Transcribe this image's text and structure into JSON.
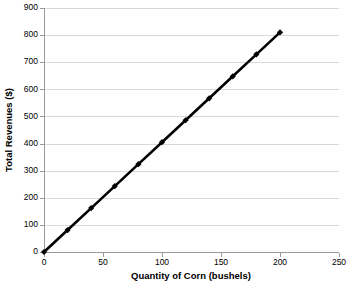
{
  "chart_data": {
    "type": "line",
    "title": "",
    "xlabel": "Quantity of Corn (bushels)",
    "ylabel": "Total Revenues ($)",
    "xlim": [
      0,
      250
    ],
    "ylim": [
      0,
      900
    ],
    "xticks": [
      0,
      50,
      100,
      150,
      200,
      250
    ],
    "xtick_labels": [
      "0",
      "50",
      "100",
      "150",
      "200",
      "250"
    ],
    "yticks": [
      0,
      100,
      200,
      300,
      400,
      500,
      600,
      700,
      800,
      900
    ],
    "ytick_labels": [
      "0",
      "100",
      "200",
      "300",
      "400",
      "500",
      "600",
      "700",
      "800",
      "900"
    ],
    "grid": "horizontal",
    "legend": "none",
    "marker": "diamond",
    "line_color": "#000000",
    "grid_color": "#d9d9d9",
    "axis_color": "#9a9a9a",
    "background_color": "#ffffff",
    "series": [
      {
        "name": "Total Revenues",
        "x": [
          0,
          20,
          40,
          60,
          80,
          100,
          120,
          140,
          160,
          180,
          200
        ],
        "values": [
          0,
          81,
          162,
          243,
          324,
          405,
          486,
          567,
          648,
          729,
          810
        ]
      }
    ]
  },
  "plot_geometry": {
    "left": 44,
    "right": 339,
    "top": 8,
    "bottom": 252
  }
}
